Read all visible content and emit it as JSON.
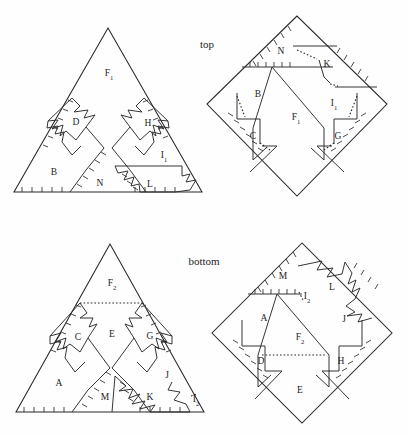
{
  "figure": {
    "background_color": "#fefefe",
    "line_color": "#262626",
    "captions": [
      {
        "id": "top",
        "text": "top",
        "x": 207,
        "y": 45
      },
      {
        "id": "bottom",
        "text": "bottom",
        "x": 204,
        "y": 262
      }
    ],
    "panels": [
      {
        "id": "top-left-triangle",
        "name": "top-left-triangle-net",
        "shape": "triangle",
        "vertices": [
          [
            108,
            28
          ],
          [
            14,
            192
          ],
          [
            202,
            192
          ]
        ],
        "labels": [
          {
            "text": "F",
            "sub": "1",
            "x": 109,
            "y": 74
          },
          {
            "text": "D",
            "sub": "",
            "x": 76,
            "y": 123
          },
          {
            "text": "H",
            "sub": "",
            "x": 148,
            "y": 124
          },
          {
            "text": "B",
            "sub": "",
            "x": 54,
            "y": 173
          },
          {
            "text": "I",
            "sub": "1",
            "x": 164,
            "y": 156
          },
          {
            "text": "N",
            "sub": "",
            "x": 100,
            "y": 184
          },
          {
            "text": "L",
            "sub": "",
            "x": 150,
            "y": 185
          }
        ]
      },
      {
        "id": "top-right-diamond",
        "name": "top-right-diamond-net",
        "shape": "square-rotated",
        "vertices": [
          [
            297,
            16
          ],
          [
            207,
            104
          ],
          [
            297,
            196
          ],
          [
            387,
            104
          ]
        ],
        "labels": [
          {
            "text": "N",
            "sub": "",
            "x": 281,
            "y": 52
          },
          {
            "text": "K",
            "sub": "",
            "x": 327,
            "y": 65
          },
          {
            "text": "B",
            "sub": "",
            "x": 258,
            "y": 95
          },
          {
            "text": "F",
            "sub": "1",
            "x": 296,
            "y": 118
          },
          {
            "text": "I",
            "sub": "1",
            "x": 334,
            "y": 104
          },
          {
            "text": "C",
            "sub": "",
            "x": 253,
            "y": 137
          },
          {
            "text": "G",
            "sub": "",
            "x": 338,
            "y": 137
          }
        ]
      },
      {
        "id": "bottom-left-triangle",
        "name": "bottom-left-triangle-net",
        "shape": "triangle",
        "vertices": [
          [
            110,
            244
          ],
          [
            16,
            412
          ],
          [
            204,
            412
          ]
        ],
        "labels": [
          {
            "text": "F",
            "sub": "2",
            "x": 112,
            "y": 284
          },
          {
            "text": "C",
            "sub": "",
            "x": 78,
            "y": 338
          },
          {
            "text": "E",
            "sub": "",
            "x": 112,
            "y": 335
          },
          {
            "text": "G",
            "sub": "",
            "x": 150,
            "y": 337
          },
          {
            "text": "A",
            "sub": "",
            "x": 59,
            "y": 384
          },
          {
            "text": "M",
            "sub": "",
            "x": 105,
            "y": 398
          },
          {
            "text": "K",
            "sub": "",
            "x": 150,
            "y": 398
          },
          {
            "text": "J",
            "sub": "",
            "x": 167,
            "y": 376
          },
          {
            "text": "I",
            "sub": "2",
            "x": 196,
            "y": 400
          }
        ]
      },
      {
        "id": "bottom-right-diamond",
        "name": "bottom-right-diamond-net",
        "shape": "square-rotated",
        "vertices": [
          [
            302,
            243
          ],
          [
            212,
            333
          ],
          [
            302,
            423
          ],
          [
            392,
            333
          ]
        ],
        "labels": [
          {
            "text": "M",
            "sub": "",
            "x": 283,
            "y": 277
          },
          {
            "text": "L",
            "sub": "",
            "x": 332,
            "y": 288
          },
          {
            "text": "A",
            "sub": "",
            "x": 264,
            "y": 319
          },
          {
            "text": "F",
            "sub": "2",
            "x": 300,
            "y": 338
          },
          {
            "text": "J",
            "sub": "",
            "x": 344,
            "y": 320
          },
          {
            "text": "D",
            "sub": "",
            "x": 261,
            "y": 362
          },
          {
            "text": "H",
            "sub": "",
            "x": 341,
            "y": 362
          },
          {
            "text": "E",
            "sub": "",
            "x": 300,
            "y": 391
          },
          {
            "text": "I",
            "sub": "2",
            "x": 307,
            "y": 297
          }
        ]
      }
    ]
  }
}
